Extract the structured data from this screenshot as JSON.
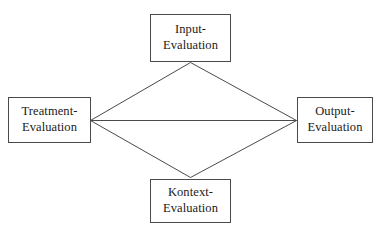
{
  "diagram": {
    "background_color": "#ffffff",
    "line_color": "#4a4a4a",
    "text_color": "#1a1a1a",
    "nodes": [
      {
        "id": "input",
        "name": "input-evaluation-node",
        "line1": "Input-",
        "line2": "Evaluation",
        "position": "top"
      },
      {
        "id": "treatment",
        "name": "treatment-evaluation-node",
        "line1": "Treatment-",
        "line2": "Evaluation",
        "position": "left"
      },
      {
        "id": "output",
        "name": "output-evaluation-node",
        "line1": "Output-",
        "line2": "Evaluation",
        "position": "right"
      },
      {
        "id": "kontext",
        "name": "kontext-evaluation-node",
        "line1": "Kontext-",
        "line2": "Evaluation",
        "position": "bottom"
      }
    ],
    "edges": [
      {
        "id": "treatment-to-input",
        "from": "treatment",
        "to": "input"
      },
      {
        "id": "input-to-output",
        "from": "input",
        "to": "output"
      },
      {
        "id": "treatment-to-kontext",
        "from": "treatment",
        "to": "kontext"
      },
      {
        "id": "kontext-to-output",
        "from": "kontext",
        "to": "output"
      },
      {
        "id": "treatment-to-output",
        "from": "treatment",
        "to": "output"
      }
    ]
  }
}
